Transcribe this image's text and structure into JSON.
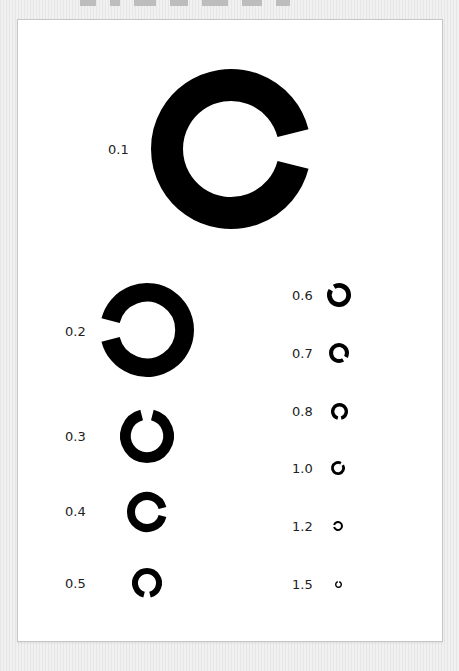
{
  "chart": {
    "colors": {
      "ring": "#000000",
      "background": "#ffffff",
      "page": "#ececec",
      "border": "#c6c6c6",
      "label": "#222222"
    },
    "rows": [
      {
        "label": "0.1",
        "gap": "right",
        "cx": 231,
        "cy": 149,
        "r": 80,
        "label_x": 108,
        "label_y": 142
      },
      {
        "label": "0.2",
        "gap": "left",
        "cx": 147,
        "cy": 330,
        "r": 47,
        "label_x": 65,
        "label_y": 324
      },
      {
        "label": "0.3",
        "gap": "top",
        "cx": 147,
        "cy": 436,
        "r": 27,
        "label_x": 65,
        "label_y": 429
      },
      {
        "label": "0.4",
        "gap": "right",
        "cx": 147,
        "cy": 512,
        "r": 20,
        "label_x": 65,
        "label_y": 504
      },
      {
        "label": "0.5",
        "gap": "bottom",
        "cx": 147,
        "cy": 583,
        "r": 15,
        "label_x": 65,
        "label_y": 576
      },
      {
        "label": "0.6",
        "gap": "upper-left",
        "cx": 339,
        "cy": 295,
        "r": 12,
        "label_x": 292,
        "label_y": 288
      },
      {
        "label": "0.7",
        "gap": "lower-right",
        "cx": 339,
        "cy": 353,
        "r": 10,
        "label_x": 292,
        "label_y": 346
      },
      {
        "label": "0.8",
        "gap": "bottom",
        "cx": 339,
        "cy": 411,
        "r": 8.5,
        "label_x": 292,
        "label_y": 404
      },
      {
        "label": "1.0",
        "gap": "upper-right",
        "cx": 338,
        "cy": 468,
        "r": 7,
        "label_x": 292,
        "label_y": 461
      },
      {
        "label": "1.2",
        "gap": "left",
        "cx": 338,
        "cy": 526,
        "r": 5,
        "label_x": 292,
        "label_y": 519
      },
      {
        "label": "1.5",
        "gap": "top",
        "cx": 338,
        "cy": 584,
        "r": 3.5,
        "label_x": 292,
        "label_y": 577
      }
    ]
  }
}
